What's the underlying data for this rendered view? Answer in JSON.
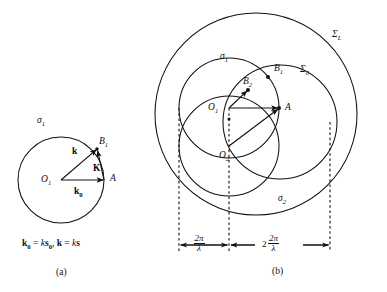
{
  "figure": {
    "background_color": "#ffffff",
    "stroke_color": "#111111"
  },
  "panel_a": {
    "caption": "(a)",
    "circles": [
      {
        "name": "sigma-1",
        "label": "σ",
        "label_sub": "1",
        "cx": 61,
        "cy": 180,
        "r": 43
      }
    ],
    "points": [
      {
        "name": "O1",
        "label": "O",
        "label_sub": "1",
        "x": 61,
        "y": 180
      },
      {
        "name": "A",
        "label": "A",
        "label_sub": "",
        "x": 104,
        "y": 180
      },
      {
        "name": "B1",
        "label": "B",
        "label_sub": "1",
        "x": 97,
        "y": 149
      }
    ],
    "vectors": [
      {
        "name": "k0",
        "label": "k",
        "label_sub": "0",
        "from": "O1",
        "to": "A"
      },
      {
        "name": "k",
        "label": "k",
        "label_sub": "",
        "from": "O1",
        "to": "B1"
      },
      {
        "name": "K",
        "label": "K",
        "label_sub": "",
        "from": "A",
        "to": "B1"
      }
    ],
    "equation": {
      "k0_vec": "k",
      "k0_sub": "0",
      "equals": "=",
      "k_scalar": "k",
      "s0_vec": "s",
      "s0_sub": "0",
      "comma": ",",
      "k_vec": "k",
      "equals2": "=",
      "k_scalar2": "k",
      "s_vec": "s"
    }
  },
  "panel_b": {
    "caption": "(b)",
    "circles": [
      {
        "name": "Sigma-L",
        "label": "Σ",
        "label_sub": "L",
        "cx": 256,
        "cy": 114,
        "r": 101
      },
      {
        "name": "Sigma-0",
        "label": "Σ",
        "label_sub": "0",
        "cx": 280,
        "cy": 122,
        "r": 57
      },
      {
        "name": "sigma-1",
        "label": "σ",
        "label_sub": "1",
        "cx": 229,
        "cy": 108,
        "r": 50
      },
      {
        "name": "sigma-2",
        "label": "σ",
        "label_sub": "2",
        "cx": 229,
        "cy": 146,
        "r": 50
      }
    ],
    "points": [
      {
        "name": "O1",
        "label": "O",
        "label_sub": "1",
        "x": 229,
        "y": 108
      },
      {
        "name": "O2",
        "label": "O",
        "label_sub": "2",
        "x": 229,
        "y": 146
      },
      {
        "name": "A",
        "label": "A",
        "label_sub": "",
        "x": 279,
        "y": 108
      },
      {
        "name": "B1",
        "label": "B",
        "label_sub": "1",
        "x": 268,
        "y": 77
      },
      {
        "name": "B2",
        "label": "B",
        "label_sub": "2",
        "x": 248,
        "y": 90
      }
    ],
    "vectors": [
      {
        "name": "O1-to-A",
        "from": "O1",
        "to": "A"
      },
      {
        "name": "O1-to-B2",
        "from": "O1",
        "to": "B2"
      },
      {
        "name": "O2-to-A",
        "from": "O2",
        "to": "A"
      }
    ],
    "dashed_lines": [
      {
        "name": "dashed-left",
        "x": 179
      },
      {
        "name": "dashed-middle",
        "x": 229
      },
      {
        "name": "dashed-right",
        "x": 330
      }
    ],
    "dimensions": [
      {
        "name": "dim-radius",
        "coefficient": "",
        "numerator": "2π",
        "denominator": "λ",
        "from_x": 179,
        "to_x": 229
      },
      {
        "name": "dim-diameter",
        "coefficient": "2",
        "numerator": "2π",
        "denominator": "λ",
        "from_x": 229,
        "to_x": 330
      }
    ]
  }
}
